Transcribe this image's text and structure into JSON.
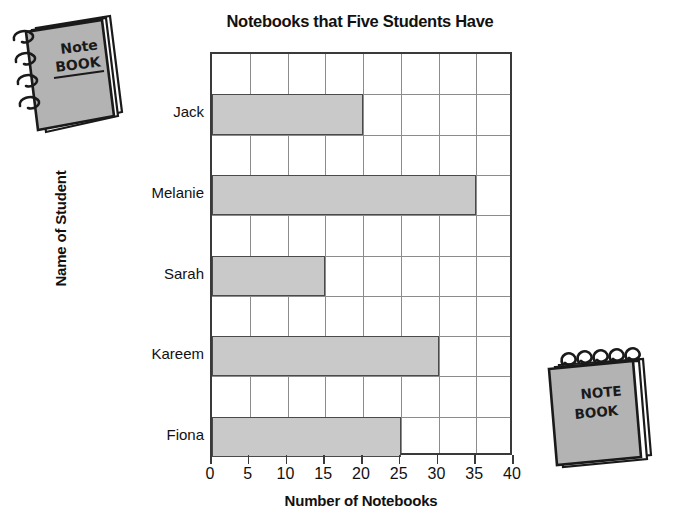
{
  "chart_data": {
    "type": "bar",
    "orientation": "horizontal",
    "title": "Notebooks that Five Students Have",
    "xlabel": "Number of Notebooks",
    "ylabel": "Name of Student",
    "categories": [
      "Jack",
      "Melanie",
      "Sarah",
      "Kareem",
      "Fiona"
    ],
    "values": [
      20,
      35,
      15,
      30,
      25
    ],
    "xlim": [
      0,
      40
    ],
    "xticks": [
      0,
      5,
      10,
      15,
      20,
      25,
      30,
      35,
      40
    ],
    "xtick_labels": [
      "0",
      "5",
      "10",
      "15",
      "20",
      "25",
      "30",
      "35",
      "40"
    ],
    "grid": true,
    "legend": "none",
    "bar_color": "#c9c9c9",
    "bar_edge_color": "#4a4a4a",
    "grid_color": "#8c8c8c",
    "axis_color": "#3a3a3a",
    "background_color": "#ffffff",
    "text_color": "#111111"
  },
  "decorations": {
    "notebook_topleft": {
      "name": "spiral-notebook-illustration",
      "line1": "Note",
      "line2": "BOOK",
      "cover_color": "#b3b3b3",
      "binding": "side-spiral"
    },
    "notebook_bottomright": {
      "name": "spiral-notepad-illustration",
      "line1": "NOTE",
      "line2": "BOOK",
      "cover_color": "#b3b3b3",
      "binding": "top-spiral"
    }
  }
}
